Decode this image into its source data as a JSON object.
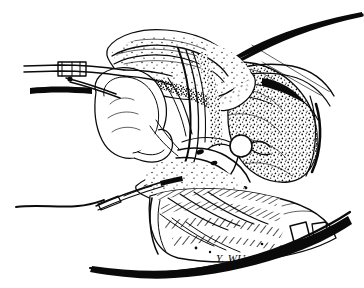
{
  "figure": {
    "kind": "anatomical-line-drawing",
    "technique": "pen-and-ink stipple and hatch",
    "alt_text": "Black and white pen-and-ink medical illustration of a sagittal pelvic section showing a hollow bladder-like organ at left, a stippled tissue mass at right with a circular vessel cross-section, a tubular catheter structure at center, hatched muscle tissue below, and surgical forceps entering from the upper left.",
    "background_color": "#ffffff",
    "ink_color": "#0a0a0a",
    "width": 364,
    "height": 288
  },
  "signature": {
    "text": "Y. WU",
    "x": 216,
    "y": 262
  },
  "regions": [
    {
      "name": "surgical-forceps",
      "label": "Surgical forceps",
      "x": 22,
      "y": 55,
      "width": 115,
      "height": 40
    },
    {
      "name": "hollow-organ",
      "label": "Hollow bladder-like organ",
      "x": 90,
      "y": 78,
      "width": 90,
      "height": 85
    },
    {
      "name": "curved-organ-superior",
      "label": "Superior curved organ",
      "x": 105,
      "y": 35,
      "width": 120,
      "height": 70
    },
    {
      "name": "oval-structure",
      "label": "Oval structure",
      "x": 205,
      "y": 62,
      "width": 55,
      "height": 55
    },
    {
      "name": "vessel-cross-section",
      "label": "Circular vessel cross-section",
      "x": 230,
      "y": 136,
      "width": 22,
      "height": 22
    },
    {
      "name": "stippled-tissue-mass",
      "label": "Stippled tissue mass",
      "x": 230,
      "y": 70,
      "width": 95,
      "height": 110
    },
    {
      "name": "catheter-tube",
      "label": "Tubular catheter",
      "x": 130,
      "y": 160,
      "width": 95,
      "height": 45
    },
    {
      "name": "hatched-muscle",
      "label": "Hatched muscle tissue",
      "x": 150,
      "y": 190,
      "width": 140,
      "height": 70
    },
    {
      "name": "upper-contour",
      "label": "Upper body contour",
      "x": 225,
      "y": 12,
      "width": 135,
      "height": 50
    },
    {
      "name": "lower-contour",
      "label": "Lower body contour",
      "x": 90,
      "y": 250,
      "width": 260,
      "height": 35
    },
    {
      "name": "left-skin-line",
      "label": "Left skin contour line",
      "x": 15,
      "y": 192,
      "width": 120,
      "height": 20
    },
    {
      "name": "needle-probe",
      "label": "Needle probe",
      "x": 95,
      "y": 165,
      "width": 80,
      "height": 40
    }
  ]
}
